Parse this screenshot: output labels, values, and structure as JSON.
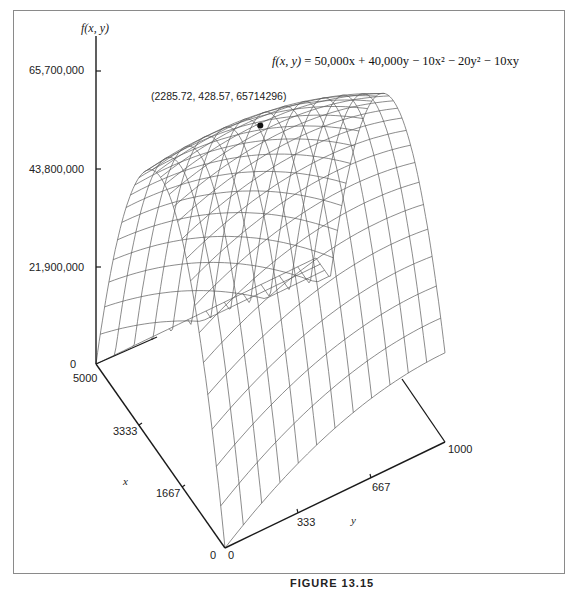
{
  "chart_data": {
    "type": "surface3d",
    "title": "",
    "equation": "f(x, y) = 50,000x + 40,000y − 10x² − 20y² − 10xy",
    "function": {
      "a_x": 50000,
      "a_y": 40000,
      "a_xx": -10,
      "a_yy": -20,
      "a_xy": -10
    },
    "zlabel": "f(x, y)",
    "xlabel": "x",
    "ylabel": "y",
    "z_ticks": [
      {
        "value": 0,
        "label": "0"
      },
      {
        "value": 21900000,
        "label": "21,900,000"
      },
      {
        "value": 43800000,
        "label": "43,800,000"
      },
      {
        "value": 65700000,
        "label": "65,700,000"
      }
    ],
    "x_ticks": [
      {
        "value": 0,
        "label": "0"
      },
      {
        "value": 1667,
        "label": "1667"
      },
      {
        "value": 3333,
        "label": "3333"
      },
      {
        "value": 5000,
        "label": "5000"
      }
    ],
    "y_ticks": [
      {
        "value": 0,
        "label": "0"
      },
      {
        "value": 333,
        "label": "333"
      },
      {
        "value": 667,
        "label": "667"
      },
      {
        "value": 1000,
        "label": "1000"
      }
    ],
    "xlim": [
      0,
      5000
    ],
    "ylim": [
      0,
      1000
    ],
    "zlim": [
      0,
      65700000
    ],
    "maximum_point": {
      "x": 2285.72,
      "y": 428.57,
      "z": 65714296,
      "label": "(2285.72, 428.57, 65714296)"
    },
    "grid": false,
    "mesh": {
      "x_lines": 30,
      "y_lines": 12
    }
  },
  "labels": {
    "zaxis_title": "f(x, y)",
    "xaxis_title": "x",
    "yaxis_title": "y",
    "z0": "0",
    "z1": "21,900,000",
    "z2": "43,800,000",
    "z3": "65,700,000",
    "x0": "0",
    "x1": "1667",
    "x2": "3333",
    "x3": "5000",
    "y0": "0",
    "y1": "333",
    "y2": "667",
    "y3": "1000",
    "max_point": "(2285.72, 428.57, 65714296)",
    "eq_lhs": "f(x, y)",
    "eq_rhs": " = 50,000x + 40,000y − 10x² − 20y² − 10xy",
    "caption": "FIGURE 13.15"
  },
  "colors": {
    "axis": "#1a1a1a",
    "mesh": "#5a5a5a",
    "frame": "#8a8a8a",
    "point": "#111111"
  }
}
